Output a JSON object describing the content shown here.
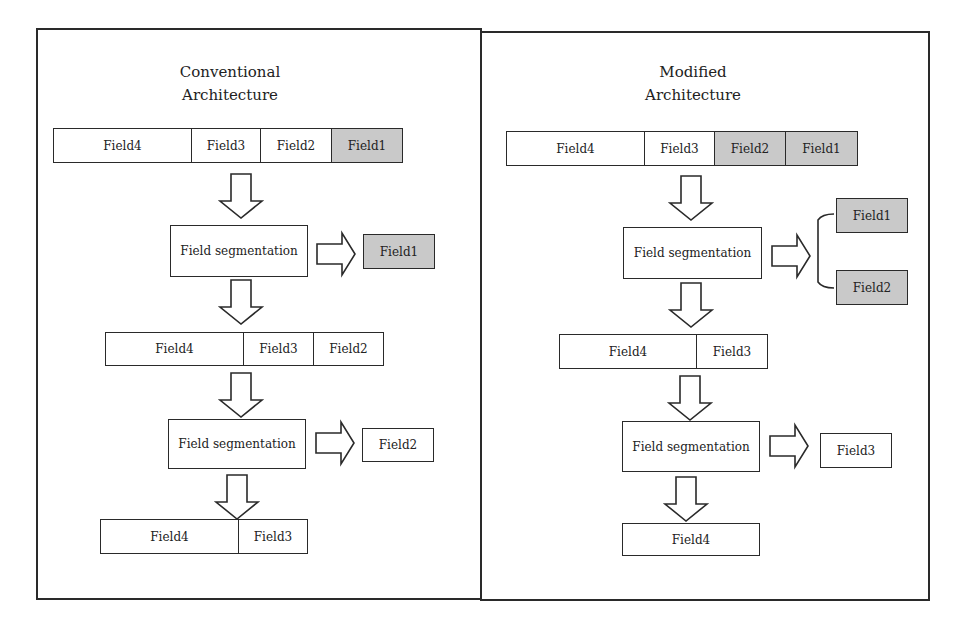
{
  "colors": {
    "stroke": "#2a2a2a",
    "shaded": "#c9c9c9",
    "background": "#ffffff"
  },
  "left": {
    "title_line1": "Conventional",
    "title_line2": "Architecture",
    "row1": [
      {
        "label": "Field4",
        "shaded": false
      },
      {
        "label": "Field3",
        "shaded": false
      },
      {
        "label": "Field2",
        "shaded": false
      },
      {
        "label": "Field1",
        "shaded": true
      }
    ],
    "seg1": "Field segmentation",
    "out1": "Field1",
    "row2": [
      {
        "label": "Field4",
        "shaded": false
      },
      {
        "label": "Field3",
        "shaded": false
      },
      {
        "label": "Field2",
        "shaded": false
      }
    ],
    "seg2": "Field segmentation",
    "out2": "Field2",
    "row3": [
      {
        "label": "Field4",
        "shaded": false
      },
      {
        "label": "Field3",
        "shaded": false
      }
    ]
  },
  "right": {
    "title_line1": "Modified",
    "title_line2": "Architecture",
    "row1": [
      {
        "label": "Field4",
        "shaded": false
      },
      {
        "label": "Field3",
        "shaded": false
      },
      {
        "label": "Field2",
        "shaded": true
      },
      {
        "label": "Field1",
        "shaded": true
      }
    ],
    "seg1": "Field segmentation",
    "out1a": "Field1",
    "out1b": "Field2",
    "row2": [
      {
        "label": "Field4",
        "shaded": false
      },
      {
        "label": "Field3",
        "shaded": false
      }
    ],
    "seg2": "Field segmentation",
    "out2": "Field3",
    "final": "Field4"
  }
}
